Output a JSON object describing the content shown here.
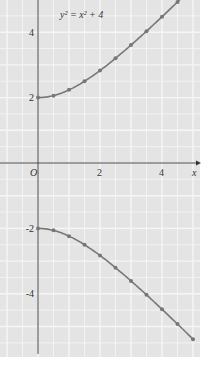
{
  "chart_data": {
    "type": "line",
    "title": "y² = x² + 4",
    "xlabel": "x",
    "ylabel": "",
    "xlim": [
      -1.2,
      5.2
    ],
    "ylim": [
      -6.0,
      5.0
    ],
    "grid": true,
    "x_ticks": [
      {
        "value": 0,
        "label": "O"
      },
      {
        "value": 2,
        "label": "2"
      },
      {
        "value": 4,
        "label": "4"
      }
    ],
    "y_ticks": [
      {
        "value": 4,
        "label": "4"
      },
      {
        "value": 2,
        "label": "2"
      },
      {
        "value": -2,
        "label": "-2"
      },
      {
        "value": -4,
        "label": "-4"
      }
    ],
    "series": [
      {
        "name": "upper branch",
        "x": [
          0,
          0.5,
          1,
          1.5,
          2,
          2.5,
          3,
          3.5,
          4,
          4.5,
          5
        ],
        "y": [
          2.0,
          2.06,
          2.24,
          2.5,
          2.83,
          3.2,
          3.61,
          4.03,
          4.47,
          4.92,
          5.39
        ]
      },
      {
        "name": "lower branch",
        "x": [
          0,
          0.5,
          1,
          1.5,
          2,
          2.5,
          3,
          3.5,
          4,
          4.5,
          5
        ],
        "y": [
          -2.0,
          -2.06,
          -2.24,
          -2.5,
          -2.83,
          -3.2,
          -3.61,
          -4.03,
          -4.47,
          -4.92,
          -5.39
        ]
      }
    ]
  },
  "labels": {
    "equation": "y² = x² + 4",
    "x_axis": "x",
    "origin": "O"
  },
  "colors": {
    "plot_bg": "#e4e4e4",
    "grid": "#f6f6f6",
    "curve": "#777777",
    "axis": "#333333"
  }
}
